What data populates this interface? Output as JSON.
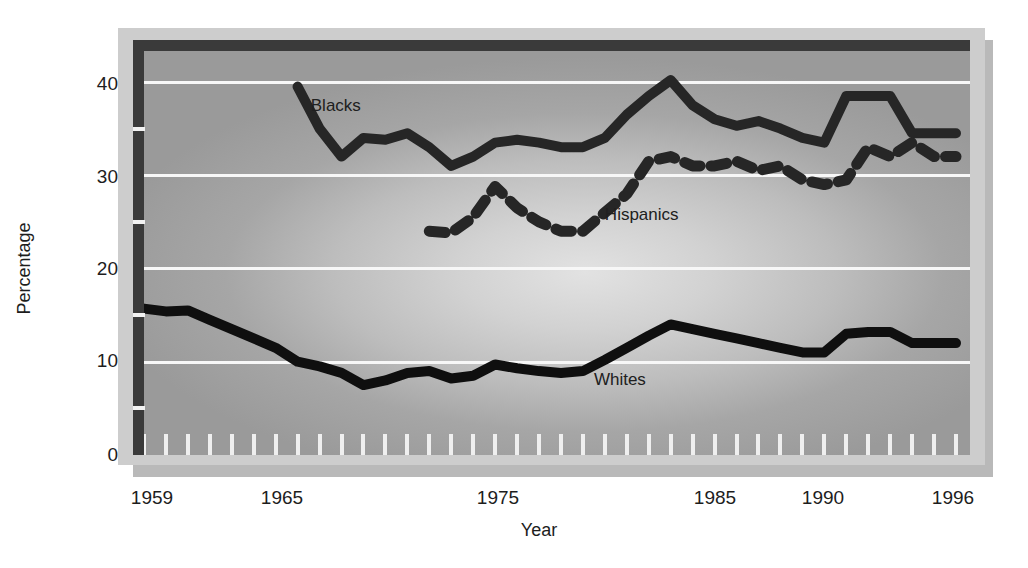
{
  "chart_data": {
    "type": "line",
    "title": "",
    "subtitle": "",
    "xlabel": "Year",
    "ylabel": "Percentage",
    "xlim": [
      1959,
      1996
    ],
    "ylim": [
      0,
      44.5
    ],
    "grid": true,
    "legend_position": "inline-labels",
    "y_ticks": [
      0,
      10,
      20,
      30,
      40
    ],
    "y_tick_labels": [
      "0",
      "10",
      "20",
      "30",
      "40"
    ],
    "x_tick_labels": [
      "1959",
      "1965",
      "1975",
      "1985",
      "1990",
      "1996"
    ],
    "x_tick_values": [
      1959,
      1965,
      1975,
      1985,
      1990,
      1996
    ],
    "minor_x_ticks_every": 1,
    "series": [
      {
        "name": "Blacks",
        "style": "solid",
        "color": "#262626",
        "label_x": 1966.6,
        "label_y": 37.4,
        "x": [
          1966,
          1967,
          1968,
          1969,
          1970,
          1971,
          1972,
          1973,
          1974,
          1975,
          1976,
          1977,
          1978,
          1979,
          1980,
          1981,
          1982,
          1983,
          1984,
          1985,
          1986,
          1987,
          1988,
          1989,
          1990,
          1991,
          1992,
          1993,
          1994,
          1995,
          1996
        ],
        "values": [
          39.5,
          35.0,
          32.0,
          34.0,
          33.8,
          34.5,
          33.0,
          31.0,
          32.0,
          33.5,
          33.8,
          33.5,
          33.0,
          33.0,
          34.0,
          36.5,
          38.5,
          40.2,
          37.5,
          36.0,
          35.3,
          35.8,
          35.0,
          34.0,
          33.5,
          38.5,
          38.5,
          38.5,
          34.5,
          34.5,
          34.5
        ]
      },
      {
        "name": "Hispanics",
        "style": "dashed",
        "color": "#262626",
        "label_x": 1980.0,
        "label_y": 25.7,
        "x": [
          1972,
          1973,
          1974,
          1975,
          1976,
          1977,
          1978,
          1979,
          1980,
          1981,
          1982,
          1983,
          1984,
          1985,
          1986,
          1987,
          1988,
          1989,
          1990,
          1991,
          1992,
          1993,
          1994,
          1995,
          1996
        ],
        "values": [
          24.0,
          23.8,
          25.5,
          28.8,
          26.5,
          25.0,
          24.0,
          24.0,
          26.0,
          28.0,
          31.5,
          32.0,
          31.0,
          31.0,
          31.5,
          30.5,
          31.0,
          29.5,
          29.0,
          29.5,
          33.0,
          32.0,
          33.5,
          32.0,
          32.0
        ]
      },
      {
        "name": "Whites",
        "style": "solid",
        "color": "#0f0f0f",
        "label_x": 1979.5,
        "label_y": 8.0,
        "x": [
          1959,
          1960,
          1961,
          1962,
          1963,
          1964,
          1965,
          1966,
          1967,
          1968,
          1969,
          1970,
          1971,
          1972,
          1973,
          1974,
          1975,
          1976,
          1977,
          1978,
          1979,
          1980,
          1981,
          1982,
          1983,
          1984,
          1985,
          1986,
          1987,
          1988,
          1989,
          1990,
          1991,
          1992,
          1993,
          1994,
          1995,
          1996
        ],
        "values": [
          15.7,
          15.4,
          15.5,
          14.5,
          13.5,
          12.5,
          11.5,
          10.0,
          9.5,
          8.8,
          7.5,
          8.0,
          8.8,
          9.0,
          8.2,
          8.5,
          9.7,
          9.3,
          9.0,
          8.8,
          9.0,
          10.2,
          11.5,
          12.8,
          14.0,
          13.5,
          13.0,
          12.5,
          12.0,
          11.5,
          11.0,
          11.0,
          13.0,
          13.2,
          13.2,
          12.0,
          12.0,
          12.0
        ]
      }
    ]
  },
  "labels": {
    "blacks": "Blacks",
    "hispanics": "Hispanics",
    "whites": "Whites",
    "axis_x": "Year",
    "axis_y": "Percentage",
    "y0": "0",
    "y10": "10",
    "y20": "20",
    "y30": "30",
    "y40": "40",
    "x1959": "1959",
    "x1965": "1965",
    "x1975": "1975",
    "x1985": "1985",
    "x1990": "1990",
    "x1996": "1996"
  },
  "colors": {
    "line": "#1a1a1a",
    "grid": "#f7f7f7",
    "panel_outer": "#cdcdcd",
    "spine": "#3a3a3a"
  }
}
